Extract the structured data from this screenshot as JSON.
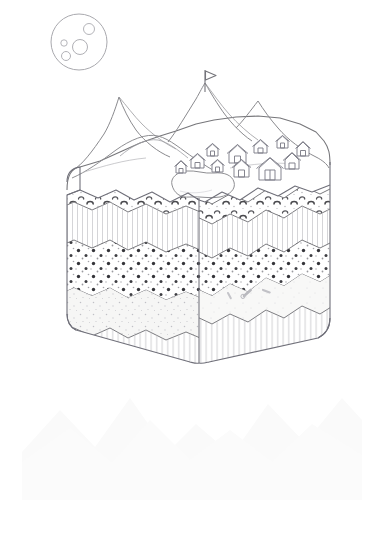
{
  "illustration": {
    "title": "Geological Block Diagram with Mountain, Village and Moon",
    "style": "line-art-sketch",
    "background_color": "#ffffff",
    "stroke_color": "#6e6e72",
    "light_stroke_color": "#b4b4b8",
    "canvas": {
      "width": 383,
      "height": 535
    }
  },
  "moon": {
    "label": "Moon",
    "center": {
      "x": 79,
      "y": 42
    },
    "radius": 28,
    "stroke_color": "#a9a9ae",
    "craters": [
      {
        "cx": 89,
        "cy": 29,
        "r": 5.5
      },
      {
        "cx": 80,
        "cy": 47,
        "r": 7.5
      },
      {
        "cx": 64,
        "cy": 43,
        "r": 3.2
      },
      {
        "cx": 66,
        "cy": 56,
        "r": 4.5
      }
    ]
  },
  "terrain": {
    "label": "Mountain Landscape Top Surface",
    "peaks": [
      {
        "name": "left-peak",
        "apex": {
          "x": 119,
          "y": 96
        }
      },
      {
        "name": "summit-peak",
        "apex": {
          "x": 205,
          "y": 83
        }
      },
      {
        "name": "right-peak",
        "apex": {
          "x": 259,
          "y": 101
        }
      }
    ],
    "foothill": {
      "name": "foreground-hill",
      "apex": {
        "x": 158,
        "y": 136
      }
    }
  },
  "flag": {
    "label": "Summit Flag",
    "pole_top": {
      "x": 205,
      "y": 72
    },
    "pole_bottom": {
      "x": 205,
      "y": 92
    },
    "banner_direction": "right"
  },
  "lake": {
    "label": "Lake",
    "center": {
      "x": 199,
      "y": 184
    },
    "outline": "irregular-blob"
  },
  "village": {
    "label": "Village",
    "house_count": 11,
    "houses": [
      {
        "x": 191,
        "y": 157,
        "w": 13,
        "h": 11
      },
      {
        "x": 207,
        "y": 147,
        "w": 11,
        "h": 9
      },
      {
        "x": 212,
        "y": 162,
        "w": 11,
        "h": 9
      },
      {
        "x": 229,
        "y": 150,
        "w": 17,
        "h": 14
      },
      {
        "x": 234,
        "y": 164,
        "w": 15,
        "h": 13
      },
      {
        "x": 254,
        "y": 143,
        "w": 13,
        "h": 11
      },
      {
        "x": 259,
        "y": 161,
        "w": 22,
        "h": 18
      },
      {
        "x": 277,
        "y": 139,
        "w": 11,
        "h": 9
      },
      {
        "x": 285,
        "y": 157,
        "w": 14,
        "h": 12
      },
      {
        "x": 297,
        "y": 146,
        "w": 12,
        "h": 10
      },
      {
        "x": 176,
        "y": 165,
        "w": 10,
        "h": 8
      }
    ]
  },
  "block": {
    "label": "Isometric Geological Block",
    "projection": "isometric-two-face",
    "front_corner": {
      "x": 199,
      "y": 345
    },
    "left_edge_x": 67,
    "right_edge_x": 329,
    "top_left": {
      "x": 67,
      "y": 168
    },
    "top_right": {
      "x": 329,
      "y": 160
    }
  },
  "strata": [
    {
      "index": 0,
      "name": "conglomerate-gravel-layer",
      "label": "Conglomerate / Gravel",
      "pattern": "crescent-clasts",
      "fill": "#fdfdfd"
    },
    {
      "index": 1,
      "name": "vertical-hatch-layer-upper",
      "label": "Fine Laminated Rock",
      "pattern": "vertical-hatch",
      "fill": "#fbfbfb"
    },
    {
      "index": 2,
      "name": "pebble-dot-layer",
      "label": "Pebbly Sandstone",
      "pattern": "dark-dots",
      "fill": "#fefefe"
    },
    {
      "index": 3,
      "name": "fine-stipple-layer",
      "label": "Fine Sandstone with Fossils",
      "pattern": "light-stipple",
      "fill": "#f7f7f6"
    },
    {
      "index": 4,
      "name": "vertical-hatch-layer-lower",
      "label": "Basement Bedrock",
      "pattern": "vertical-hatch",
      "fill": "#fcfcfc"
    }
  ],
  "fossils": {
    "label": "Fossil Fragments",
    "count": 3,
    "items": [
      {
        "x": 244,
        "y": 295,
        "angle": -40
      },
      {
        "x": 262,
        "y": 289,
        "angle": 15
      },
      {
        "x": 228,
        "y": 288,
        "angle": 60
      }
    ]
  },
  "watermark": {
    "label": "Faint Mountain Silhouette Watermark",
    "region": {
      "x": 20,
      "y": 385,
      "width": 345,
      "height": 125
    },
    "color": "#fbfbfb"
  }
}
